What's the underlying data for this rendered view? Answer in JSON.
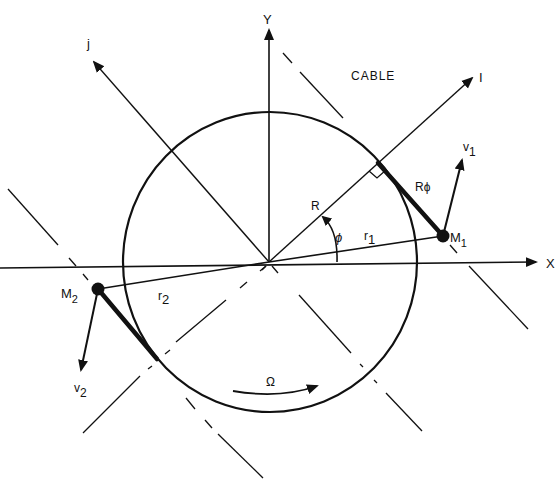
{
  "diagram": {
    "title_label": "CABLE",
    "axes": {
      "x_label": "X",
      "y_label": "Y",
      "i_label": "I",
      "j_label": "j"
    },
    "masses": [
      {
        "label": "M",
        "sub": "1",
        "velocity_label": "v",
        "velocity_sub": "1",
        "radius_label": "r",
        "radius_sub": "1"
      },
      {
        "label": "M",
        "sub": "2",
        "velocity_label": "v",
        "velocity_sub": "2",
        "radius_label": "r",
        "radius_sub": "2"
      }
    ],
    "radius_label": "R",
    "angle_label": "ϕ",
    "arc_length_label": "Rϕ",
    "rotation_label": "Ω",
    "colors": {
      "ink": "#111111",
      "background": "#ffffff"
    }
  }
}
